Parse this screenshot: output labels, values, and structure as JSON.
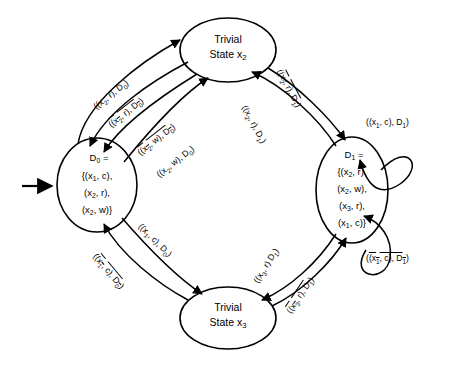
{
  "figure": {
    "background_color": "#ffffff",
    "stroke_color": "#000000"
  },
  "nodes": [
    {
      "id": "d0",
      "name": "state-node-d0",
      "shape": "ellipse",
      "lines": [
        "D0 =",
        "{(x1, c),",
        "(x2, r),",
        "(x2, w)}"
      ],
      "line1": "D",
      "line1_sub": "0",
      "line1_rest": " =",
      "line2": "{(x",
      "line2_sub": "1",
      "line2_rest": ", c),",
      "line3": "(x",
      "line3_sub": "2",
      "line3_rest": ", r),",
      "line4": "(x",
      "line4_sub": "2",
      "line4_rest": ", w)}"
    },
    {
      "id": "x2",
      "name": "state-node-x2",
      "shape": "ellipse",
      "line1": "Trivial",
      "line2": "State x",
      "line2_sub": "2"
    },
    {
      "id": "d1",
      "name": "state-node-d1",
      "shape": "ellipse",
      "line1": "D",
      "line1_sub": "1",
      "line1_rest": " =",
      "line2": "{(x",
      "line2_sub": "2",
      "line2_rest": ", r),",
      "line3": "(x",
      "line3_sub": "2",
      "line3_rest": ", w),",
      "line4": "(x",
      "line4_sub": "3",
      "line4_rest": ", r),",
      "line5": "(x",
      "line5_sub": "1",
      "line5_rest": ", c)}"
    },
    {
      "id": "x3",
      "name": "state-node-x3",
      "shape": "ellipse",
      "line1": "Trivial",
      "line2": "State x",
      "line2_sub": "3"
    }
  ],
  "edges": [
    {
      "id": "e1",
      "name": "edge-label-d0-to-x2",
      "from": "d0",
      "to": "x2",
      "text": "((x2, r), D0)",
      "overline": false,
      "parts": {
        "pre": "((x",
        "sub1": "2",
        "mid": ", r), D",
        "sub2": "0",
        "post": ")"
      }
    },
    {
      "id": "e2",
      "name": "edge-label-x2-to-d0-bar",
      "from": "x2",
      "to": "d0",
      "text": "((x2, r), D0)",
      "overline": true,
      "parts": {
        "pre": "((x",
        "sub1": "2",
        "mid": ", r), D",
        "sub2": "0",
        "post": ")"
      }
    },
    {
      "id": "e3",
      "name": "edge-label-x2-to-d0-w-bar",
      "from": "x2",
      "to": "d0",
      "text": "((x2, w), D0)",
      "overline": true,
      "parts": {
        "pre": "((x",
        "sub1": "2",
        "mid": ", w), D",
        "sub2": "0",
        "post": ")"
      }
    },
    {
      "id": "e4",
      "name": "edge-label-d0-to-x2-w",
      "from": "d0",
      "to": "x2",
      "text": "((x2, w), D0)",
      "overline": false,
      "parts": {
        "pre": "((x",
        "sub1": "2",
        "mid": ", w), D",
        "sub2": "0",
        "post": ")"
      }
    },
    {
      "id": "e5",
      "name": "edge-label-x2-to-d1-bar",
      "from": "x2",
      "to": "d1",
      "text": "((x2, r), D1)",
      "overline": true,
      "parts": {
        "pre": "((x",
        "sub1": "2",
        "mid": ", r), D",
        "sub2": "1",
        "post": ")"
      }
    },
    {
      "id": "e6",
      "name": "edge-label-d1-to-x2",
      "from": "d1",
      "to": "x2",
      "text": "((x2, r), D1)",
      "overline": false,
      "parts": {
        "pre": "((x",
        "sub1": "2",
        "mid": ", r), D",
        "sub2": "1",
        "post": ")"
      }
    },
    {
      "id": "e7",
      "name": "edge-label-d1-selfloop-top",
      "from": "d1",
      "to": "d1",
      "text": "((x1, c), D1)",
      "overline": false,
      "parts": {
        "pre": "((x",
        "sub1": "1",
        "mid": ", c), D",
        "sub2": "1",
        "post": ")"
      }
    },
    {
      "id": "e8",
      "name": "edge-label-d1-selfloop-bottom-bar",
      "from": "d1",
      "to": "d1",
      "text": "((x1, c), D1)",
      "overline": true,
      "parts": {
        "pre": "((x",
        "sub1": "1",
        "mid": ", c), D",
        "sub2": "1",
        "post": ")"
      }
    },
    {
      "id": "e9",
      "name": "edge-label-d0-to-x3",
      "from": "d0",
      "to": "x3",
      "text": "((x1, c), D0)",
      "overline": false,
      "parts": {
        "pre": "((x",
        "sub1": "1",
        "mid": ", c), D",
        "sub2": "0",
        "post": ")"
      }
    },
    {
      "id": "e10",
      "name": "edge-label-x3-to-d0-bar",
      "from": "x3",
      "to": "d0",
      "text": "((x1, c), D0)",
      "overline": true,
      "parts": {
        "pre": "((x",
        "sub1": "1",
        "mid": ", c), D",
        "sub2": "0",
        "post": ")"
      }
    },
    {
      "id": "e11",
      "name": "edge-label-d1-to-x3",
      "from": "d1",
      "to": "x3",
      "text": "((x3, r) D1)",
      "overline": false,
      "parts": {
        "pre": "((x",
        "sub1": "3",
        "mid": ", r) D",
        "sub2": "1",
        "post": ")"
      }
    },
    {
      "id": "e12",
      "name": "edge-label-x3-to-d1-bar",
      "from": "x3",
      "to": "d1",
      "text": "((x3, r), D1)",
      "overline": true,
      "parts": {
        "pre": "((x",
        "sub1": "3",
        "mid": ", r), D",
        "sub2": "1",
        "post": ")"
      }
    }
  ],
  "start_arrow": {
    "name": "start-arrow",
    "target": "d0"
  }
}
